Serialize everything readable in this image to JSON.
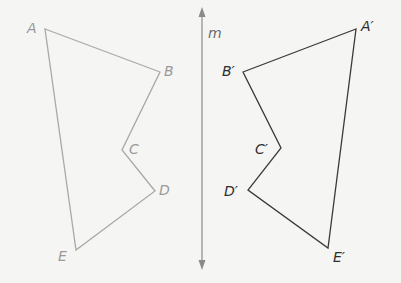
{
  "diagram": {
    "type": "reflection",
    "line_of_reflection": {
      "label": "m",
      "color": "#8a8a8a"
    },
    "preimage": {
      "color": "#a9a9a9",
      "label_color": "#9a9a9a",
      "vertices": [
        {
          "label": "A",
          "x": 45,
          "y": 29
        },
        {
          "label": "B",
          "x": 160,
          "y": 72
        },
        {
          "label": "C",
          "x": 122,
          "y": 150
        },
        {
          "label": "D",
          "x": 155,
          "y": 191
        },
        {
          "label": "E",
          "x": 76,
          "y": 250
        }
      ]
    },
    "image": {
      "color": "#3a3a3a",
      "label_color": "#2e2e2e",
      "vertices": [
        {
          "label": "A′",
          "x": 356,
          "y": 29
        },
        {
          "label": "B′",
          "x": 243,
          "y": 72
        },
        {
          "label": "C′",
          "x": 281,
          "y": 148
        },
        {
          "label": "D′",
          "x": 248,
          "y": 190
        },
        {
          "label": "E′",
          "x": 328,
          "y": 248
        }
      ]
    }
  }
}
